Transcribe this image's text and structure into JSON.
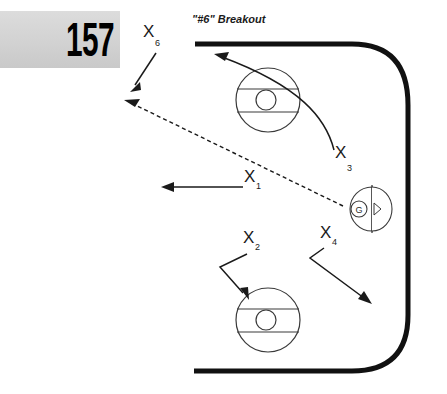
{
  "page": {
    "background_color": "#ffffff",
    "width": 447,
    "height": 394
  },
  "plate": {
    "number": "157",
    "background_color": "#d4d4d4"
  },
  "header": {
    "title": "\"#6\" Breakout"
  },
  "rink": {
    "line_color": "#111111",
    "mark_color": "#3a3a3a",
    "description": "hockey rink end zone, rounded right corner boards"
  },
  "goal": {
    "goalie_label": "G"
  },
  "players": [
    {
      "id": "p1",
      "label": "X",
      "subscript": "1",
      "x": 246,
      "y": 182,
      "movement": "skate-left"
    },
    {
      "id": "p2",
      "label": "X",
      "subscript": "2",
      "x": 250,
      "y": 243,
      "movement": "skate-down-left-then-down"
    },
    {
      "id": "p3",
      "label": "X",
      "subscript": "3",
      "x": 340,
      "y": 158,
      "movement": "curl-up-left-to-blueline"
    },
    {
      "id": "p4",
      "label": "X",
      "subscript": "4",
      "x": 328,
      "y": 237,
      "movement": "skate-down-right"
    },
    {
      "id": "p6",
      "label": "X",
      "subscript": "6",
      "x": 147,
      "y": 36,
      "movement": "skate-down-left"
    }
  ],
  "pass": {
    "style": "dashed",
    "from": "goal-area",
    "to": "upper-left-corner"
  },
  "faceoff_circles": [
    {
      "id": "fc-top",
      "cx": 268,
      "cy": 100,
      "r": 32
    },
    {
      "id": "fc-bottom",
      "cx": 268,
      "cy": 320,
      "r": 32
    }
  ]
}
